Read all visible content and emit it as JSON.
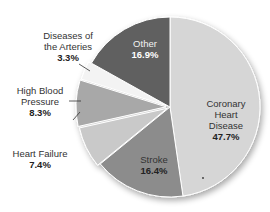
{
  "chart_data": {
    "type": "pie",
    "title": "",
    "categories": [
      "Coronary Heart Disease",
      "Stroke",
      "Heart Failure",
      "High Blood Pressure",
      "Diseases of the Arteries",
      "Other"
    ],
    "values": [
      47.7,
      16.4,
      7.4,
      8.3,
      3.3,
      16.9
    ],
    "unit": "%",
    "start_angle": "12 o'clock",
    "direction": "clockwise",
    "colors": [
      "#d6d6d6",
      "#8c8c8c",
      "#c9c9c9",
      "#a8a8a8",
      "#f3f3f3",
      "#606060"
    ],
    "labels": [
      {
        "name": "Coronary Heart Disease",
        "lines": [
          "Coronary",
          "Heart",
          "Disease"
        ],
        "pct": "47.7%"
      },
      {
        "name": "Stroke",
        "lines": [
          "Stroke"
        ],
        "pct": "16.4%"
      },
      {
        "name": "Heart Failure",
        "lines": [
          "Heart Failure"
        ],
        "pct": "7.4%"
      },
      {
        "name": "High Blood Pressure",
        "lines": [
          "High Blood",
          "Pressure"
        ],
        "pct": "8.3%"
      },
      {
        "name": "Diseases of the Arteries",
        "lines": [
          "Diseases of",
          "the Arteries"
        ],
        "pct": "3.3%"
      },
      {
        "name": "Other",
        "lines": [
          "Other"
        ],
        "pct": "16.9%"
      }
    ],
    "legend": "none (direct labels)"
  },
  "labels": {
    "chd_1": "Coronary",
    "chd_2": "Heart",
    "chd_3": "Disease",
    "chd_pct": "47.7%",
    "stroke": "Stroke",
    "stroke_pct": "16.4%",
    "hf": "Heart Failure",
    "hf_pct": "7.4%",
    "hbp_1": "High Blood",
    "hbp_2": "Pressure",
    "hbp_pct": "8.3%",
    "art_1": "Diseases of",
    "art_2": "the Arteries",
    "art_pct": "3.3%",
    "other": "Other",
    "other_pct": "16.9%"
  }
}
